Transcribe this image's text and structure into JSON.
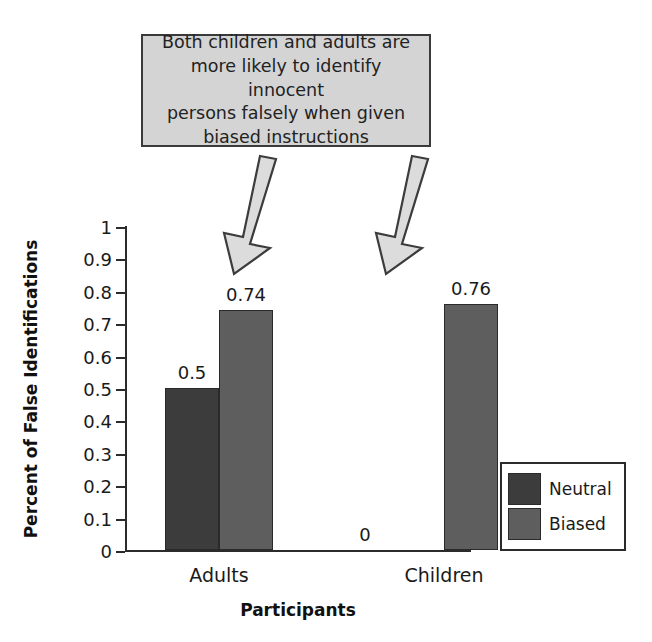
{
  "callout": {
    "text": "Both children and adults are\nmore likely to identify innocent\npersons falsely when given\nbiased instructions",
    "fill_color": "#d4d4d4",
    "border_color": "#3a3a3a"
  },
  "arrows": [
    {
      "name": "arrow-to-adults-biased"
    },
    {
      "name": "arrow-to-children-biased"
    }
  ],
  "legend": {
    "position": "bottom-right",
    "items": [
      {
        "label": "Neutral",
        "color": "#3c3c3c"
      },
      {
        "label": "Biased",
        "color": "#5e5e5e"
      }
    ]
  },
  "chart_data": {
    "type": "bar",
    "title": "",
    "xlabel": "Participants",
    "ylabel": "Percent of False Identifications",
    "categories": [
      "Adults",
      "Children"
    ],
    "series": [
      {
        "name": "Neutral",
        "color": "#3c3c3c",
        "values": [
          0.5,
          0
        ]
      },
      {
        "name": "Biased",
        "color": "#5e5e5e",
        "values": [
          0.74,
          0.76
        ]
      }
    ],
    "value_labels": [
      {
        "text": "0.5",
        "series": "Neutral",
        "category": "Adults"
      },
      {
        "text": "0.74",
        "series": "Biased",
        "category": "Adults"
      },
      {
        "text": "0",
        "series": "Neutral",
        "category": "Children"
      },
      {
        "text": "0.76",
        "series": "Biased",
        "category": "Children"
      }
    ],
    "ylim": [
      0,
      1
    ],
    "yticks": [
      0,
      0.1,
      0.2,
      0.3,
      0.4,
      0.5,
      0.6,
      0.7,
      0.8,
      0.9,
      1
    ],
    "ytick_labels": [
      "0",
      "0.1",
      "0.2",
      "0.3",
      "0.4",
      "0.5",
      "0.6",
      "0.7",
      "0.8",
      "0.9",
      "1"
    ],
    "grid": false,
    "legend_position": "bottom-right"
  }
}
